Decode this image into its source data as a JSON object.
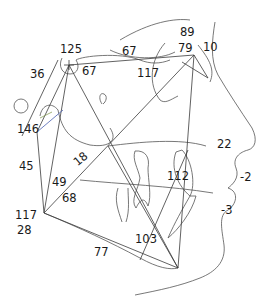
{
  "diagram": {
    "type": "cephalometric-tracing",
    "colors": {
      "line": "#3a3a3a",
      "trace": "#555555",
      "text": "#1a1a1a",
      "accent_green": "#8aa05a",
      "accent_blue": "#4a5fb0"
    },
    "measurements": [
      {
        "id": "m125",
        "value": "125",
        "x": 60,
        "y": 44
      },
      {
        "id": "m36",
        "value": "36",
        "x": 30,
        "y": 69
      },
      {
        "id": "m67a",
        "value": "67",
        "x": 82,
        "y": 66
      },
      {
        "id": "m67b",
        "value": "67",
        "x": 122,
        "y": 46
      },
      {
        "id": "m89",
        "value": "89",
        "x": 180,
        "y": 27
      },
      {
        "id": "m79",
        "value": "79",
        "x": 178,
        "y": 43
      },
      {
        "id": "m10",
        "value": "10",
        "x": 203,
        "y": 42
      },
      {
        "id": "m117a",
        "value": "117",
        "x": 137,
        "y": 68
      },
      {
        "id": "m146",
        "value": "146",
        "x": 17,
        "y": 124
      },
      {
        "id": "m22",
        "value": "22",
        "x": 217,
        "y": 139
      },
      {
        "id": "m45",
        "value": "45",
        "x": 19,
        "y": 161
      },
      {
        "id": "m18",
        "value": "18",
        "x": 78,
        "y": 164,
        "rotated": true
      },
      {
        "id": "m112",
        "value": "112",
        "x": 167,
        "y": 171
      },
      {
        "id": "m-2",
        "value": "-2",
        "x": 240,
        "y": 172
      },
      {
        "id": "m49",
        "value": "49",
        "x": 52,
        "y": 177
      },
      {
        "id": "m68",
        "value": "68",
        "x": 62,
        "y": 193
      },
      {
        "id": "m-3",
        "value": "-3",
        "x": 221,
        "y": 205
      },
      {
        "id": "m117b",
        "value": "117",
        "x": 15,
        "y": 210
      },
      {
        "id": "m28",
        "value": "28",
        "x": 17,
        "y": 225
      },
      {
        "id": "m103",
        "value": "103",
        "x": 135,
        "y": 234
      },
      {
        "id": "m77",
        "value": "77",
        "x": 94,
        "y": 247
      }
    ]
  }
}
